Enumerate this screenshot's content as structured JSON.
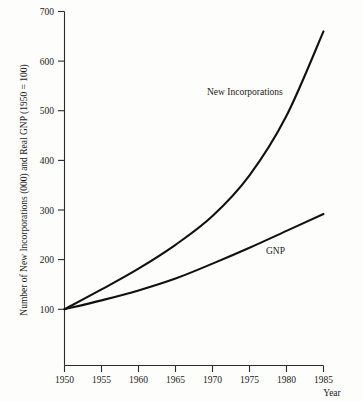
{
  "chart_data": {
    "type": "line",
    "title": "",
    "subtitle": "",
    "xlabel": "Year",
    "ylabel": "Number of New Incorporations (000) and Real GNP (1950 = 100)",
    "xlim": [
      1950,
      1985
    ],
    "ylim": [
      0,
      700
    ],
    "grid": false,
    "legend_position": "inline-annotation",
    "x_ticks": [
      "1950",
      "1955",
      "1960",
      "1965",
      "1970",
      "1975",
      "1980",
      "1985"
    ],
    "y_ticks": [
      "100",
      "200",
      "300",
      "400",
      "500",
      "600",
      "700"
    ],
    "x": [
      1950,
      1955,
      1960,
      1965,
      1970,
      1975,
      1980,
      1985
    ],
    "series": [
      {
        "name": "New Incorporations",
        "label": "New Incorporations",
        "values": [
          100,
          140,
          182,
          230,
          288,
          370,
          490,
          660
        ],
        "color": "#111111"
      },
      {
        "name": "GNP",
        "label": "GNP",
        "values": [
          100,
          118,
          138,
          162,
          192,
          224,
          258,
          292
        ],
        "color": "#111111"
      }
    ],
    "annotations": [
      {
        "text": "New Incorporations",
        "x_px": 207,
        "y_px": 92
      },
      {
        "text": "GNP",
        "x_px": 267,
        "y_px": 251
      }
    ]
  },
  "figure": {
    "background_color": "#fdfdfb",
    "axis_color": "#2b2b2b",
    "line_color": "#111111"
  }
}
